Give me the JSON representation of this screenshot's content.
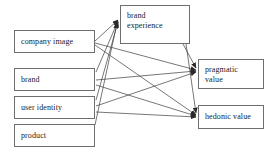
{
  "diagram": {
    "type": "flow-diagram",
    "title": "",
    "canvas": {
      "width": 279,
      "height": 156,
      "background": "#ffffff"
    },
    "style": {
      "box_border": "#6e6e6e",
      "line_color": "#3c3c3c",
      "text_color": "#1b1b1b"
    },
    "nodes": [
      {
        "id": "company-image",
        "label": "company image",
        "x": 14,
        "y": 30,
        "w": 81,
        "h": 23,
        "lines": 1
      },
      {
        "id": "brand",
        "label": "brand",
        "x": 14,
        "y": 68,
        "w": 81,
        "h": 23,
        "lines": 1
      },
      {
        "id": "user-identity",
        "label": "user identity",
        "x": 14,
        "y": 96,
        "w": 81,
        "h": 23,
        "lines": 1
      },
      {
        "id": "product",
        "label": "product",
        "x": 14,
        "y": 124,
        "w": 81,
        "h": 23,
        "lines": 1
      },
      {
        "id": "brand-experience",
        "label": "brand\nexperience",
        "x": 120,
        "y": 5,
        "w": 70,
        "h": 39,
        "lines": 2
      },
      {
        "id": "pragmatic-value",
        "label": "pragmatic\nvalue",
        "x": 198,
        "y": 59,
        "w": 66,
        "h": 30,
        "lines": 2
      },
      {
        "id": "hedonic-value",
        "label": "hedonic value",
        "x": 198,
        "y": 105,
        "w": 66,
        "h": 24,
        "lines": 1
      }
    ],
    "edges": [
      {
        "id": "company-image-to-brand-experience",
        "from": "company image",
        "to": "brand experience",
        "points": "95,41 118,20"
      },
      {
        "id": "company-image-to-pragmatic-value",
        "from": "company image",
        "to": "pragmatic value",
        "points": "95,43 196,70"
      },
      {
        "id": "company-image-to-hedonic-value",
        "from": "company image",
        "to": "hedonic value",
        "points": "95,45 196,115"
      },
      {
        "id": "brand-to-brand-experience",
        "from": "brand",
        "to": "brand experience",
        "points": "96,72 118,21"
      },
      {
        "id": "brand-to-pragmatic-value",
        "from": "brand",
        "to": "pragmatic value",
        "points": "96,80 196,71"
      },
      {
        "id": "brand-to-hedonic-value",
        "from": "brand",
        "to": "hedonic value",
        "points": "96,85 196,116"
      },
      {
        "id": "user-identity-to-brand-experience",
        "from": "user identity",
        "to": "brand experience",
        "points": "96,100 118,22"
      },
      {
        "id": "user-identity-to-pragmatic-value",
        "from": "user identity",
        "to": "pragmatic value",
        "points": "96,106 196,72"
      },
      {
        "id": "user-identity-to-hedonic-value",
        "from": "user identity",
        "to": "hedonic value",
        "points": "96,112 196,117"
      },
      {
        "id": "product-to-brand-experience",
        "from": "product",
        "to": "brand experience",
        "points": "95,125 117,23"
      },
      {
        "id": "brand-experience-to-pragmatic-value",
        "from": "brand experience",
        "to": "pragmatic value",
        "points": "183,44 196,68"
      },
      {
        "id": "brand-experience-to-hedonic-value",
        "from": "brand experience",
        "to": "hedonic value",
        "points": "186,44 196,113"
      }
    ]
  }
}
